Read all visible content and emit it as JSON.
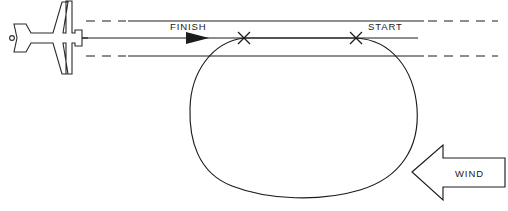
{
  "diagram": {
    "labels": {
      "finish": "FINISH",
      "start": "START",
      "wind": "WIND"
    },
    "colors": {
      "ink": "#1c1c1c",
      "background": "#ffffff",
      "plane_outline": "#2b2b2b"
    },
    "markers": [
      {
        "name": "finish-cross",
        "symbol": "×",
        "x": 244,
        "y": 38
      },
      {
        "name": "start-cross",
        "symbol": "×",
        "x": 356,
        "y": 38
      }
    ],
    "reference_lines": [
      {
        "name": "upper-reference-line",
        "y": 21,
        "dashed_lead": true,
        "dashed_tail": true
      },
      {
        "name": "center-flight-path",
        "y": 38,
        "dashed_lead": false,
        "dashed_tail": false
      },
      {
        "name": "lower-reference-line",
        "y": 56,
        "dashed_lead": true,
        "dashed_tail": true
      }
    ],
    "track": {
      "name": "racetrack-loop",
      "left": 190,
      "right": 418,
      "top": 38,
      "bottom": 196
    },
    "direction_arrow": {
      "name": "flight-direction-arrow",
      "points_to": "right"
    },
    "wind_arrow": {
      "name": "wind-direction-arrow",
      "points_to": "left"
    },
    "aircraft": {
      "name": "aircraft-silhouette",
      "view": "top",
      "heading": "right"
    }
  }
}
